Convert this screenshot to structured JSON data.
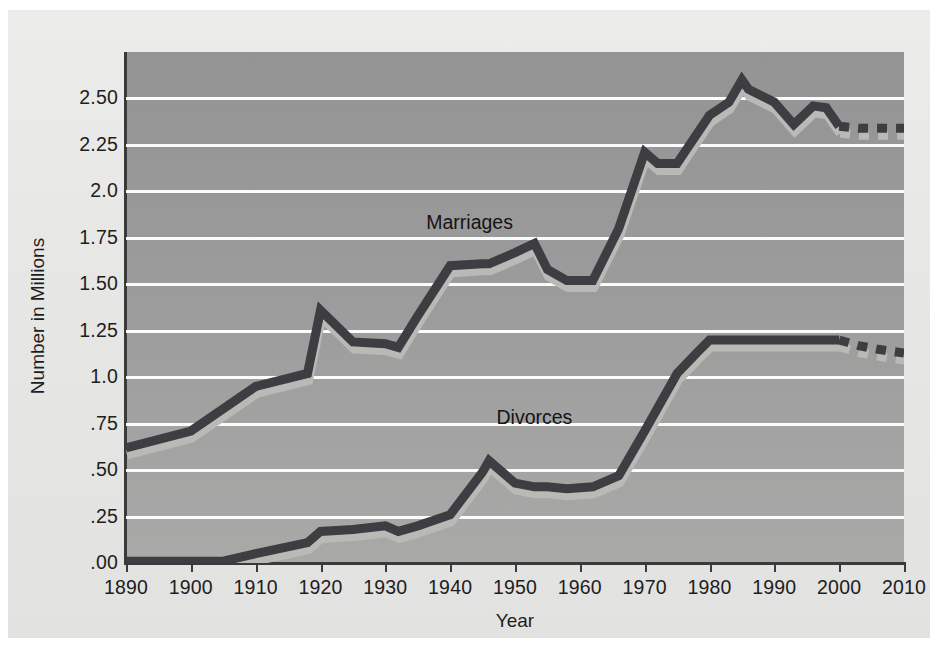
{
  "figure": {
    "background_color": "#ffffff",
    "panel_color": "#e8e8e6",
    "plot_background_color": "#9b9b9b",
    "gridline_color": "#fbfbfb",
    "axis_color": "#3a3a3a"
  },
  "chart_data": {
    "type": "line",
    "title": "",
    "subtitle": "",
    "xlabel": "Year",
    "ylabel": "Number in Millions",
    "grid": true,
    "legend_position": "inline-annotation",
    "xlim": [
      1890,
      2010
    ],
    "ylim": [
      0.0,
      2.75
    ],
    "xticks": [
      1890,
      1900,
      1910,
      1920,
      1930,
      1940,
      1950,
      1960,
      1970,
      1980,
      1990,
      2000,
      2010
    ],
    "xtick_labels": [
      "1890",
      "1900",
      "1910",
      "1920",
      "1930",
      "1940",
      "1950",
      "1960",
      "1970",
      "1980",
      "1990",
      "2000",
      "2010"
    ],
    "yticks": [
      0.0,
      0.25,
      0.5,
      0.75,
      1.0,
      1.25,
      1.5,
      1.75,
      2.0,
      2.25,
      2.5
    ],
    "ytick_labels": [
      ".00",
      ".25",
      ".50",
      ".75",
      "1.0",
      "1.25",
      "1.50",
      "1.75",
      "2.0",
      "2.25",
      "2.50"
    ],
    "line_color": "#3d3d42",
    "shadow_color": "#b9b9b6",
    "series": [
      {
        "name": "Marriages",
        "label": "Marriages",
        "label_x": 1943,
        "label_y": 1.83,
        "style": "solid",
        "x": [
          1890,
          1900,
          1910,
          1918,
          1920,
          1925,
          1930,
          1932,
          1935,
          1940,
          1945,
          1946,
          1950,
          1953,
          1955,
          1958,
          1962,
          1966,
          1970,
          1972,
          1975,
          1980,
          1983,
          1985,
          1986,
          1990,
          1993,
          1996,
          1998,
          2000
        ],
        "y": [
          0.62,
          0.71,
          0.95,
          1.02,
          1.36,
          1.19,
          1.18,
          1.16,
          1.33,
          1.6,
          1.61,
          1.61,
          1.67,
          1.72,
          1.58,
          1.52,
          1.52,
          1.8,
          2.21,
          2.15,
          2.15,
          2.41,
          2.48,
          2.6,
          2.55,
          2.48,
          2.36,
          2.46,
          2.45,
          2.35
        ],
        "projection_style": "dashed",
        "projection_x": [
          2000,
          2003,
          2006,
          2008,
          2010
        ],
        "projection_y": [
          2.35,
          2.34,
          2.34,
          2.34,
          2.34
        ]
      },
      {
        "name": "Divorces",
        "label": "Divorces",
        "label_x": 1953,
        "label_y": 0.78,
        "style": "solid",
        "x": [
          1890,
          1900,
          1905,
          1910,
          1918,
          1920,
          1925,
          1930,
          1932,
          1935,
          1940,
          1945,
          1946,
          1950,
          1953,
          1955,
          1958,
          1962,
          1966,
          1970,
          1975,
          1978,
          1980,
          1985,
          1990,
          1995,
          2000
        ],
        "y": [
          0.01,
          0.01,
          0.01,
          0.05,
          0.11,
          0.17,
          0.18,
          0.2,
          0.17,
          0.2,
          0.26,
          0.49,
          0.55,
          0.43,
          0.41,
          0.41,
          0.4,
          0.41,
          0.47,
          0.71,
          1.02,
          1.13,
          1.2,
          1.2,
          1.2,
          1.2,
          1.2
        ],
        "projection_style": "dashed",
        "projection_x": [
          2000,
          2003,
          2006,
          2008,
          2010
        ],
        "projection_y": [
          1.2,
          1.17,
          1.15,
          1.14,
          1.13
        ]
      }
    ]
  }
}
